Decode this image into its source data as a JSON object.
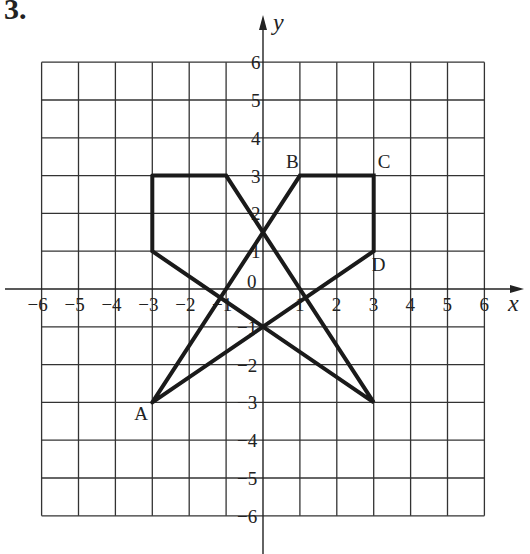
{
  "problem": {
    "number": "3."
  },
  "axes": {
    "x_label": "x",
    "y_label": "y",
    "x_ticks": [
      "-6",
      "-5",
      "-4",
      "-3",
      "-2",
      "-1",
      "0",
      "1",
      "2",
      "3",
      "4",
      "5",
      "6"
    ],
    "y_ticks": [
      "6",
      "5",
      "4",
      "3",
      "2",
      "1",
      "0",
      "-1",
      "-2",
      "-3",
      "-4",
      "-5",
      "-6"
    ]
  },
  "points": [
    {
      "label": "A",
      "x": -3,
      "y": -3
    },
    {
      "label": "B",
      "x": 1,
      "y": 3
    },
    {
      "label": "C",
      "x": 3,
      "y": 3
    },
    {
      "label": "D",
      "x": 3,
      "y": 1
    }
  ],
  "chart_data": {
    "type": "scatter",
    "title": "3.",
    "xlabel": "x",
    "ylabel": "y",
    "xlim": [
      -6,
      6
    ],
    "ylim": [
      -6,
      6
    ],
    "grid": true,
    "series": [
      {
        "name": "Figure 1 (pentagon-like)",
        "closed": true,
        "points": [
          [
            -3,
            3
          ],
          [
            -1,
            3
          ],
          [
            3,
            -3
          ],
          [
            -3,
            1
          ],
          [
            -3,
            3
          ]
        ]
      },
      {
        "name": "Figure 2 ABCD",
        "closed": true,
        "points": [
          [
            -3,
            -3
          ],
          [
            1,
            3
          ],
          [
            3,
            3
          ],
          [
            3,
            1
          ],
          [
            -3,
            -3
          ]
        ],
        "labels": [
          "A",
          "B",
          "C",
          "D"
        ]
      }
    ]
  }
}
